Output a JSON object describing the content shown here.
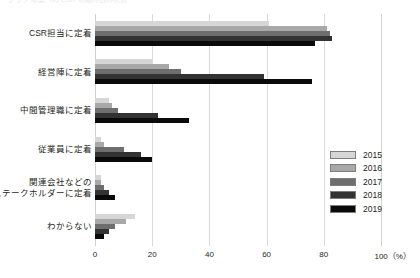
{
  "clipped_top_text": "グラフ 本業への CSR の組み込み状況",
  "chart_data": {
    "type": "bar",
    "orientation": "horizontal",
    "title": "",
    "subtitle": "",
    "xlabel": "(%)",
    "ylabel": "",
    "xlim": [
      0,
      100
    ],
    "xticks": [
      0,
      20,
      40,
      60,
      80,
      100
    ],
    "xtick_labels": [
      "0",
      "20",
      "40",
      "60",
      "80",
      "100（%）"
    ],
    "grid": true,
    "legend_position": "right-middle",
    "categories": [
      "CSR担当に定着",
      "経営陣に定着",
      "中間管理職に定着",
      "従業員に定着",
      "関連会社などの\nステークホルダーに定着",
      "わからない"
    ],
    "category_lines": [
      [
        "CSR担当に定着"
      ],
      [
        "経営陣に定着"
      ],
      [
        "中間管理職に定着"
      ],
      [
        "従業員に定着"
      ],
      [
        "関連会社などの",
        "ステークホルダーに定着"
      ],
      [
        "わからない"
      ]
    ],
    "series": [
      {
        "name": "2015",
        "color": "#d6d6d6",
        "values": [
          61,
          20,
          5,
          2,
          2,
          14
        ]
      },
      {
        "name": "2016",
        "color": "#a8a8a8",
        "values": [
          81,
          26,
          6,
          3,
          2,
          11
        ]
      },
      {
        "name": "2017",
        "color": "#6e6e6e",
        "values": [
          82,
          30,
          8,
          10,
          3,
          7
        ]
      },
      {
        "name": "2018",
        "color": "#333333",
        "values": [
          83,
          59,
          22,
          16,
          5,
          5
        ]
      },
      {
        "name": "2019",
        "color": "#0a0a0a",
        "values": [
          77,
          76,
          33,
          20,
          7,
          3
        ]
      }
    ]
  },
  "legend": {
    "entries": [
      {
        "label": "2015",
        "color": "#d6d6d6"
      },
      {
        "label": "2016",
        "color": "#a8a8a8"
      },
      {
        "label": "2017",
        "color": "#6e6e6e"
      },
      {
        "label": "2018",
        "color": "#333333"
      },
      {
        "label": "2019",
        "color": "#0a0a0a"
      }
    ]
  },
  "colors": {
    "background": "#ffffff",
    "text": "#231f20",
    "gridline": "#d9d9d9"
  }
}
